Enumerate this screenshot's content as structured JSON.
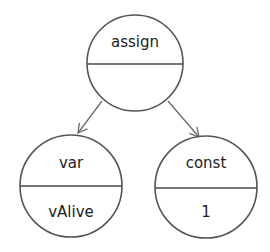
{
  "diagram": {
    "type": "tree",
    "nodes": [
      {
        "id": "assign",
        "top": "assign",
        "bottom": ""
      },
      {
        "id": "var",
        "top": "var",
        "bottom": "vAlive"
      },
      {
        "id": "const",
        "top": "const",
        "bottom": "1"
      }
    ],
    "edges": [
      {
        "from": "assign",
        "to": "var"
      },
      {
        "from": "assign",
        "to": "const"
      }
    ],
    "colors": {
      "stroke": "#555555",
      "text": "#222222",
      "background": "#ffffff"
    }
  }
}
